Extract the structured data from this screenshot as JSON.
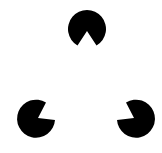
{
  "figure": {
    "type": "kanizsa-triangle-illusion",
    "background": "#ffffff",
    "fill": "#000000",
    "inducers": [
      {
        "name": "top",
        "cx": 87,
        "cy": 29,
        "r": 19,
        "notch_direction": "down"
      },
      {
        "name": "bottom-left",
        "cx": 36,
        "cy": 119,
        "r": 19,
        "notch_direction": "up-right"
      },
      {
        "name": "bottom-right",
        "cx": 136,
        "cy": 119,
        "r": 19,
        "notch_direction": "up-left"
      }
    ]
  }
}
